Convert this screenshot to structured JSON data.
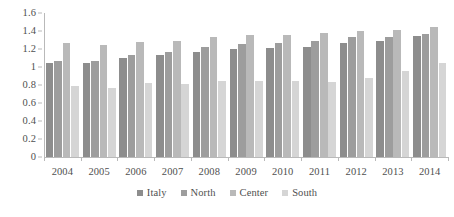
{
  "chart_data": {
    "type": "bar",
    "title": "",
    "subtitle": "",
    "xlabel": "",
    "ylabel": "",
    "categories": [
      "2004",
      "2005",
      "2006",
      "2007",
      "2008",
      "2009",
      "2010",
      "2011",
      "2012",
      "2013",
      "2014"
    ],
    "series": [
      {
        "name": "Italy",
        "color": "#8d8d8d",
        "values": [
          1.05,
          1.05,
          1.1,
          1.13,
          1.17,
          1.2,
          1.21,
          1.22,
          1.27,
          1.29,
          1.34
        ]
      },
      {
        "name": "North",
        "color": "#9d9d9d",
        "values": [
          1.07,
          1.07,
          1.13,
          1.17,
          1.22,
          1.26,
          1.27,
          1.29,
          1.33,
          1.33,
          1.37
        ]
      },
      {
        "name": "Center",
        "color": "#b9b9b9",
        "values": [
          1.27,
          1.25,
          1.28,
          1.29,
          1.33,
          1.36,
          1.36,
          1.38,
          1.4,
          1.41,
          1.45
        ]
      },
      {
        "name": "South",
        "color": "#d5d5d5",
        "values": [
          0.79,
          0.77,
          0.82,
          0.81,
          0.85,
          0.85,
          0.84,
          0.83,
          0.88,
          0.96,
          1.05
        ]
      }
    ],
    "ylim": [
      0,
      1.6
    ],
    "ytick_step": 0.2,
    "yticks": [
      "0",
      "0.2",
      "0.4",
      "0.6",
      "0.8",
      "1",
      "1.2",
      "1.4",
      "1.6"
    ],
    "grid": false,
    "legend_position": "bottom",
    "legend_entries": [
      "Italy",
      "North",
      "Center",
      "South"
    ]
  },
  "axis": {
    "line_color": "#b9b9b9",
    "tick_color": "#b9b9b9",
    "text_color": "#4f4f4f"
  }
}
